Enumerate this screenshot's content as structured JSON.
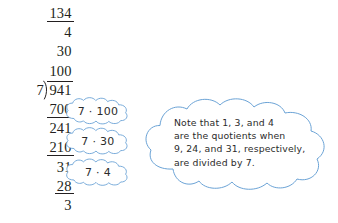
{
  "figure": {
    "name": "long-division-with-annotation-clouds",
    "background_color": "#ffffff",
    "ink_color": "#231f20",
    "cloud_stroke_color": "#6ba3d6",
    "cloud_fill_color": "#ffffff",
    "cloud_text_color": "#2b2b2b"
  },
  "division": {
    "operation": "941 divided by 7",
    "divisor": "7",
    "dividend": "941",
    "bracket_glyph": "division-bracket",
    "partial_quotients": [
      {
        "value": "134",
        "underlined": true
      },
      {
        "value": "4",
        "underlined": false
      },
      {
        "value": "30",
        "underlined": false
      },
      {
        "value": "100",
        "underlined": false
      }
    ],
    "work_rows": [
      {
        "value": "700",
        "underlined": true
      },
      {
        "value": "241",
        "underlined": false
      },
      {
        "value": "210",
        "underlined": true
      },
      {
        "value": "31",
        "underlined": false
      },
      {
        "value": "28",
        "underlined": true
      },
      {
        "value": "3",
        "underlined": false
      }
    ]
  },
  "clouds": {
    "step_labels": [
      {
        "id": "cloud-7-times-100",
        "text": "7 · 100"
      },
      {
        "id": "cloud-7-times-30",
        "text": "7 · 30"
      },
      {
        "id": "cloud-7-times-4",
        "text": "7 · 4"
      }
    ],
    "note": {
      "id": "note-cloud",
      "lines": [
        "Note that 1, 3, and 4",
        "are the quotients when",
        "9, 24, and 31, respectively,",
        "are divided by 7."
      ]
    }
  }
}
